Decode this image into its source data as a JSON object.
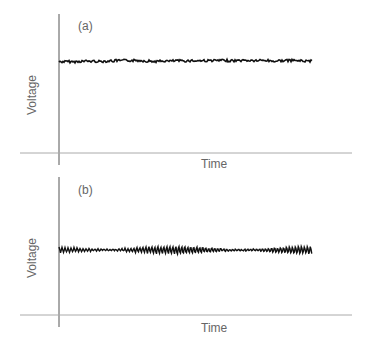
{
  "chart_data": [
    {
      "type": "line",
      "panel_label": "(a)",
      "title": "",
      "xlabel": "Time",
      "ylabel": "Voltage",
      "grid": false,
      "legend": null,
      "description": "Nearly flat voltage trace with small-amplitude random noise (low variation)",
      "series": [
        {
          "name": "signal",
          "level": 0.72,
          "noise_amplitude": 0.02,
          "oscillation": "none"
        }
      ]
    },
    {
      "type": "line",
      "panel_label": "(b)",
      "title": "",
      "xlabel": "Time",
      "ylabel": "Voltage",
      "grid": false,
      "legend": null,
      "description": "Voltage trace at similar level with larger, regular high-frequency oscillations",
      "series": [
        {
          "name": "signal",
          "level": 0.52,
          "noise_amplitude": 0.06,
          "oscillation": "periodic"
        }
      ]
    }
  ],
  "panels": {
    "a": {
      "tag": "(a)",
      "xlabel": "Time",
      "ylabel": "Voltage"
    },
    "b": {
      "tag": "(b)",
      "xlabel": "Time",
      "ylabel": "Voltage"
    }
  }
}
